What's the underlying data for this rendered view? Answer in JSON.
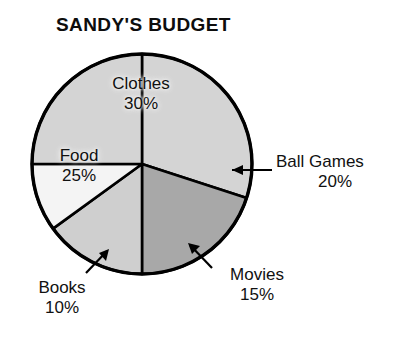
{
  "chart": {
    "title": "SANDY'S BUDGET"
  },
  "chart_data": {
    "type": "pie",
    "title": "SANDY'S BUDGET",
    "xlabel": "",
    "ylabel": "",
    "legend_position": "none",
    "grid": false,
    "start_angle_deg": 0,
    "direction": "clockwise",
    "categories": [
      "Clothes",
      "Ball Games",
      "Movies",
      "Books",
      "Food"
    ],
    "values": [
      30,
      20,
      15,
      10,
      25
    ],
    "unit": "%",
    "slices": [
      {
        "name": "clothes",
        "label": "Clothes",
        "value": 30,
        "pct_text": "30%",
        "color": "#d4d4d4",
        "label_placement": "inside"
      },
      {
        "name": "ball-games",
        "label": "Ball Games",
        "value": 20,
        "pct_text": "20%",
        "color": "#a8a8a8",
        "label_placement": "outside-right",
        "leader": "line"
      },
      {
        "name": "movies",
        "label": "Movies",
        "value": 15,
        "pct_text": "15%",
        "color": "#cfcfcf",
        "label_placement": "outside-bottom",
        "leader": "arrow"
      },
      {
        "name": "books",
        "label": "Books",
        "value": 10,
        "pct_text": "10%",
        "color": "#f4f4f4",
        "label_placement": "outside-bottom-left",
        "leader": "arrow"
      },
      {
        "name": "food",
        "label": "Food",
        "value": 25,
        "pct_text": "25%",
        "color": "#d4d4d4",
        "label_placement": "inside"
      }
    ]
  },
  "colors": {
    "outline": "#000000",
    "background": "#ffffff",
    "text": "#111111"
  }
}
